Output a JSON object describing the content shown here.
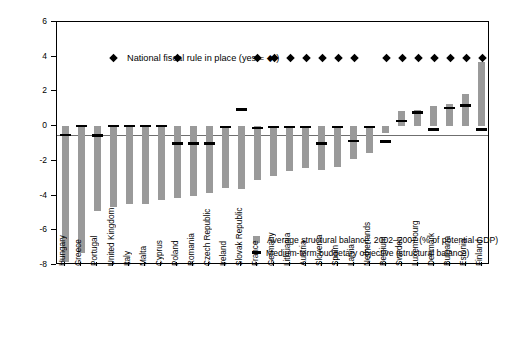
{
  "chart_data": {
    "type": "bar",
    "title": "",
    "annotation": "National fiscal rule in place (yes = ◆ )",
    "xlabel": "",
    "ylabel": "",
    "ylim": [
      -8,
      6
    ],
    "yticks": [
      6,
      4,
      2,
      0,
      -2,
      -4,
      -6,
      -8
    ],
    "ytick_labels": [
      "6",
      "4",
      "2",
      "0",
      "-2",
      "-4",
      "-6",
      "-8"
    ],
    "grid": false,
    "legend_position": "inside-lower-right",
    "legend": [
      "Average structural balance, 2002–2007 (% of potential GDP)",
      "Medium-term budgetary objective (structural balance)"
    ],
    "categories": [
      "Hungary",
      "Greece",
      "Portugal",
      "United Kingdom",
      "Italy",
      "Malta",
      "Cyprus",
      "Poland",
      "Romania",
      "Czech Republic",
      "Ireland",
      "Slovak Republic",
      "France",
      "Germany",
      "Lithuania",
      "Austria",
      "Slovenia",
      "Spain",
      "Latvia",
      "Netherlands",
      "Belgium",
      "Sweden",
      "Luxembourg",
      "Denmark",
      "Bulgaria",
      "Estonia",
      "Finland"
    ],
    "series": [
      {
        "name": "Average structural balance, 2002–2007 (% of potential GDP)",
        "type": "bar",
        "color": "#9a9a9a",
        "values": [
          -7.8,
          -7.3,
          -4.9,
          -4.65,
          -4.5,
          -4.5,
          -4.25,
          -4.15,
          -4.05,
          -3.85,
          -3.55,
          -3.6,
          -3.1,
          -2.85,
          -2.6,
          -2.4,
          -2.55,
          -2.35,
          -1.9,
          -1.55,
          -0.4,
          0.85,
          0.95,
          1.15,
          1.25,
          1.85,
          3.7
        ]
      },
      {
        "name": "Medium-term budgetary objective (structural balance)",
        "type": "marker-line",
        "color": "#000000",
        "values": [
          -0.5,
          0.0,
          -0.55,
          0.0,
          0.0,
          0.0,
          0.0,
          -1.0,
          -1.0,
          -1.0,
          -0.05,
          0.95,
          -0.1,
          -0.05,
          -0.05,
          -0.05,
          -1.0,
          -0.05,
          -0.85,
          -0.05,
          -0.9,
          0.3,
          0.8,
          -0.2,
          1.05,
          1.2,
          -0.2
        ]
      },
      {
        "name": "National fiscal rule in place",
        "type": "marker-diamond",
        "color": "#000000",
        "marker_value": 3.95,
        "countries_with_rule": [
          "United Kingdom",
          "Poland",
          "France",
          "Germany",
          "Lithuania",
          "Austria",
          "Slovenia",
          "Spain",
          "Latvia",
          "Belgium",
          "Sweden",
          "Luxembourg",
          "Denmark",
          "Bulgaria",
          "Estonia",
          "Finland"
        ],
        "values": [
          0,
          0,
          0,
          1,
          0,
          0,
          0,
          1,
          0,
          0,
          0,
          0,
          1,
          1,
          1,
          1,
          1,
          1,
          1,
          0,
          1,
          1,
          1,
          1,
          1,
          1,
          1
        ]
      }
    ]
  }
}
